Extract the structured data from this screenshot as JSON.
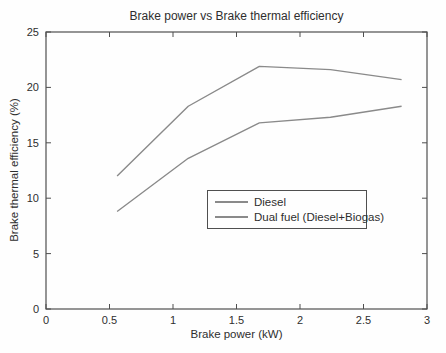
{
  "chart_data": {
    "type": "line",
    "title": "Brake power vs Brake thermal efficiency",
    "xlabel": "Brake power (kW)",
    "ylabel": "Brake thermal efficiency (%)",
    "xlim": [
      0,
      3
    ],
    "ylim": [
      0,
      25
    ],
    "xticks": [
      0,
      0.5,
      1,
      1.5,
      2,
      2.5,
      3
    ],
    "xtick_labels": [
      "0",
      "0.5",
      "1",
      "1.5",
      "2",
      "2.5",
      "3"
    ],
    "yticks": [
      0,
      5,
      10,
      15,
      20,
      25
    ],
    "ytick_labels": [
      "0",
      "5",
      "10",
      "15",
      "20",
      "25"
    ],
    "grid": false,
    "legend_position": "inside lower-center",
    "x": [
      0.56,
      1.12,
      1.68,
      2.24,
      2.8
    ],
    "series": [
      {
        "name": "Diesel",
        "color": "#8a8a8a",
        "values": [
          12.0,
          18.3,
          21.9,
          21.6,
          20.7
        ]
      },
      {
        "name": "Dual fuel (Diesel+Biogas)",
        "color": "#8a8a8a",
        "values": [
          8.8,
          13.6,
          16.8,
          17.3,
          18.3
        ]
      }
    ],
    "axis_color": "#4f4f4f",
    "text_color": "#2e2e2e"
  }
}
